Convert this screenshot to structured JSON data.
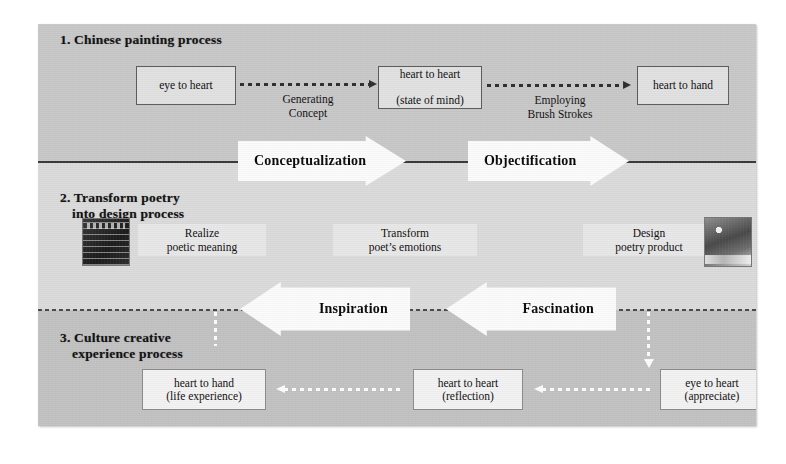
{
  "figure": {
    "caption": "",
    "bands": [
      {
        "id": "band1",
        "title": "1. Chinese painting  process",
        "color": "#c9c9c9"
      },
      {
        "id": "band2",
        "title_line1": "2. Transform poetry",
        "title_line2": "into design process",
        "color": "#dcdcdc"
      },
      {
        "id": "band3",
        "title_line1": "3. Culture creative",
        "title_line2": "experience process",
        "color": "#c3c3c3"
      }
    ]
  },
  "band1": {
    "title": "1. Chinese painting  process",
    "nodes": [
      {
        "name": "eye-to-heart",
        "line1": "eye to heart",
        "line2": ""
      },
      {
        "name": "heart-to-heart",
        "line1": "heart to heart",
        "line2": "(state of mind)"
      },
      {
        "name": "heart-to-hand",
        "line1": "heart to hand",
        "line2": ""
      }
    ],
    "connectors": [
      {
        "name": "generating-concept",
        "line1": "Generating",
        "line2": "Concept"
      },
      {
        "name": "employing-brush-strokes",
        "line1": "Employing",
        "line2": "Brush Strokes"
      }
    ]
  },
  "band2": {
    "title_line1": "2. Transform poetry",
    "title_line2": "into design process",
    "labels": [
      {
        "name": "realize-poetic-meaning",
        "line1": "Realize",
        "line2": "poetic meaning"
      },
      {
        "name": "transform-poets-emotions",
        "line1": "Transform",
        "line2": "poet’s emotions"
      },
      {
        "name": "design-poetry-product",
        "line1": "Design",
        "line2": "poetry product"
      }
    ],
    "thumbnails": [
      {
        "name": "poem-thumbnail"
      },
      {
        "name": "poetry-product-thumbnail"
      }
    ]
  },
  "band3": {
    "title_line1": "3. Culture creative",
    "title_line2": "experience process",
    "nodes": [
      {
        "name": "heart-to-hand-life",
        "line1": "heart to hand",
        "line2": "(life experience)"
      },
      {
        "name": "heart-to-heart-reflection",
        "line1": "heart to heart",
        "line2": "(reflection)"
      },
      {
        "name": "eye-to-heart-appreciate",
        "line1": "eye to heart",
        "line2": "(appreciate)"
      }
    ]
  },
  "arrows": {
    "conceptualization": "Conceptualization",
    "objectification": "Objectification",
    "inspiration": "Inspiration",
    "fascination": "Fascination"
  },
  "colors": {
    "band1": "#c9c9c9",
    "band2": "#dcdcdc",
    "band3": "#c3c3c3",
    "arrow_fill": "#fcfcfc",
    "text": "#0f0f0f",
    "dotted_dark": "#2f2f2f",
    "dotted_light": "#fdfdfd"
  }
}
